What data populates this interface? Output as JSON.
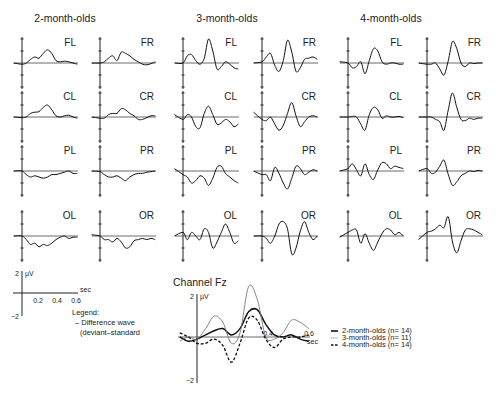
{
  "chart_data": {
    "type": "line",
    "groups": [
      {
        "name": "2-month-olds",
        "channels": [
          {
            "label": "FL",
            "x": [
              -0.1,
              0,
              0.05,
              0.1,
              0.15,
              0.2,
              0.25,
              0.3,
              0.35,
              0.4,
              0.45,
              0.5,
              0.55,
              0.6,
              0.65
            ],
            "y": [
              0,
              -0.1,
              0,
              0.3,
              0.5,
              0.4,
              0.8,
              1.1,
              0.8,
              0.2,
              0.1,
              0.15,
              0.1,
              0,
              -0.1
            ]
          },
          {
            "label": "FR",
            "x": [
              -0.1,
              0,
              0.05,
              0.1,
              0.15,
              0.2,
              0.25,
              0.3,
              0.35,
              0.4,
              0.45,
              0.5,
              0.55,
              0.6,
              0.65
            ],
            "y": [
              0,
              0,
              0.1,
              0.4,
              0.6,
              0.2,
              0.9,
              0.8,
              0.6,
              0.3,
              0.1,
              -0.1,
              -0.15,
              -0.05,
              0.1
            ]
          },
          {
            "label": "CL",
            "x": [
              -0.1,
              0,
              0.05,
              0.1,
              0.15,
              0.2,
              0.25,
              0.3,
              0.35,
              0.4,
              0.45,
              0.5,
              0.55,
              0.6,
              0.65
            ],
            "y": [
              0,
              -0.05,
              0,
              0.3,
              0.4,
              0.45,
              0.8,
              1.0,
              0.6,
              0.1,
              0,
              0.1,
              0.15,
              0,
              -0.1
            ]
          },
          {
            "label": "CR",
            "x": [
              -0.1,
              0,
              0.05,
              0.1,
              0.15,
              0.2,
              0.25,
              0.3,
              0.35,
              0.4,
              0.45,
              0.5,
              0.55,
              0.6,
              0.65
            ],
            "y": [
              0,
              -0.1,
              -0.1,
              0.2,
              0.3,
              0.3,
              0.7,
              0.6,
              0.3,
              0.1,
              -0.2,
              -0.2,
              -0.05,
              0.1,
              0.1
            ]
          },
          {
            "label": "PL",
            "x": [
              -0.1,
              0,
              0.05,
              0.1,
              0.15,
              0.2,
              0.25,
              0.3,
              0.35,
              0.4,
              0.45,
              0.5,
              0.55,
              0.6,
              0.65
            ],
            "y": [
              0,
              0,
              -0.3,
              -0.5,
              -0.4,
              -0.5,
              -0.6,
              -0.5,
              -0.3,
              -0.3,
              -0.2,
              -0.1,
              0,
              -0.2,
              -0.2
            ]
          },
          {
            "label": "PR",
            "x": [
              -0.1,
              0,
              0.05,
              0.1,
              0.15,
              0.2,
              0.25,
              0.3,
              0.35,
              0.4,
              0.45,
              0.5,
              0.55,
              0.6,
              0.65
            ],
            "y": [
              0,
              -0.05,
              -0.3,
              -0.5,
              -0.5,
              -0.4,
              -0.6,
              -0.8,
              -0.5,
              -0.3,
              -0.2,
              -0.2,
              -0.1,
              -0.05,
              0
            ]
          },
          {
            "label": "OL",
            "x": [
              -0.1,
              0,
              0.05,
              0.1,
              0.15,
              0.2,
              0.25,
              0.3,
              0.35,
              0.4,
              0.45,
              0.5,
              0.55,
              0.6,
              0.65
            ],
            "y": [
              0,
              0,
              -0.3,
              -0.7,
              -0.6,
              -0.9,
              -0.7,
              -0.8,
              -0.6,
              -0.3,
              -0.1,
              0,
              -0.2,
              -0.1,
              -0.1
            ]
          },
          {
            "label": "OR",
            "x": [
              -0.1,
              0,
              0.05,
              0.1,
              0.15,
              0.2,
              0.25,
              0.3,
              0.35,
              0.4,
              0.45,
              0.5,
              0.55,
              0.6,
              0.65
            ],
            "y": [
              0.1,
              0,
              -0.3,
              -0.3,
              -0.5,
              -0.2,
              -0.5,
              -1.0,
              -0.9,
              -0.4,
              -0.3,
              -0.2,
              -0.3,
              -0.2,
              -0.3
            ]
          }
        ]
      },
      {
        "name": "3-month-olds",
        "channels": [
          {
            "label": "FL",
            "x": [
              -0.1,
              0,
              0.05,
              0.1,
              0.15,
              0.2,
              0.25,
              0.3,
              0.35,
              0.4,
              0.45,
              0.5,
              0.55,
              0.6,
              0.65
            ],
            "y": [
              0,
              0,
              0.6,
              0.7,
              0.2,
              -0.1,
              0.4,
              2.0,
              1.0,
              -0.5,
              -0.3,
              0.1,
              -0.1,
              -0.4,
              -0.5
            ]
          },
          {
            "label": "FR",
            "x": [
              -0.1,
              0,
              0.05,
              0.1,
              0.15,
              0.2,
              0.25,
              0.3,
              0.35,
              0.4,
              0.45,
              0.5,
              0.55,
              0.6,
              0.65
            ],
            "y": [
              0,
              0.1,
              0.5,
              0.8,
              -0.2,
              -0.7,
              0.2,
              1.9,
              0.9,
              -0.7,
              -0.4,
              0.3,
              0.4,
              0.5,
              0.3
            ]
          },
          {
            "label": "CL",
            "x": [
              -0.1,
              0,
              0.05,
              0.1,
              0.15,
              0.2,
              0.25,
              0.3,
              0.35,
              0.4,
              0.45,
              0.5,
              0.55,
              0.6,
              0.65
            ],
            "y": [
              0.2,
              -0.2,
              0.2,
              0,
              -0.8,
              -0.9,
              0.3,
              0.9,
              0.2,
              -0.6,
              -0.5,
              -0.2,
              -0.4,
              -0.8,
              -0.6
            ]
          },
          {
            "label": "CR",
            "x": [
              -0.1,
              0,
              0.05,
              0.1,
              0.15,
              0.2,
              0.25,
              0.3,
              0.35,
              0.4,
              0.45,
              0.5,
              0.55,
              0.6,
              0.65
            ],
            "y": [
              0.4,
              -0.2,
              -0.3,
              0,
              -0.6,
              -1.1,
              -0.7,
              0.3,
              1.2,
              0.1,
              -0.8,
              -0.4,
              0,
              0.1,
              0
            ]
          },
          {
            "label": "PL",
            "x": [
              -0.1,
              0,
              0.05,
              0.1,
              0.15,
              0.2,
              0.25,
              0.3,
              0.35,
              0.4,
              0.45,
              0.5,
              0.55,
              0.6,
              0.65
            ],
            "y": [
              0.2,
              -0.3,
              -0.5,
              -1.0,
              -0.8,
              -0.4,
              -0.6,
              -1.2,
              -0.6,
              0.3,
              0.4,
              -0.2,
              -0.5,
              -0.8,
              -1.0
            ]
          },
          {
            "label": "PR",
            "x": [
              -0.1,
              0,
              0.05,
              0.1,
              0.15,
              0.2,
              0.25,
              0.3,
              0.35,
              0.4,
              0.45,
              0.5,
              0.55,
              0.6,
              0.65
            ],
            "y": [
              0,
              -0.3,
              -0.3,
              -0.8,
              0.3,
              -0.2,
              -1.0,
              -1.5,
              -0.6,
              0.4,
              0.2,
              -0.3,
              -0.1,
              0.1,
              0
            ]
          },
          {
            "label": "OL",
            "x": [
              -0.1,
              0,
              0.05,
              0.1,
              0.15,
              0.2,
              0.25,
              0.3,
              0.35,
              0.4,
              0.45,
              0.5,
              0.55,
              0.6,
              0.65
            ],
            "y": [
              0,
              0.3,
              -0.3,
              0.3,
              0,
              -0.3,
              0.6,
              0.3,
              -1.0,
              -0.5,
              0.3,
              1.0,
              0.3,
              -0.6,
              -0.4
            ]
          },
          {
            "label": "OR",
            "x": [
              -0.1,
              0,
              0.05,
              0.1,
              0.15,
              0.2,
              0.25,
              0.3,
              0.35,
              0.4,
              0.45,
              0.5,
              0.55,
              0.6,
              0.65
            ],
            "y": [
              0,
              0,
              -0.2,
              -0.6,
              0,
              1.0,
              1.2,
              0.6,
              -1.5,
              -1.0,
              0.4,
              1.2,
              0.3,
              -0.3,
              0
            ]
          }
        ]
      },
      {
        "name": "4-month-olds",
        "channels": [
          {
            "label": "FL",
            "x": [
              -0.1,
              0,
              0.05,
              0.1,
              0.15,
              0.2,
              0.25,
              0.3,
              0.35,
              0.4,
              0.45,
              0.5,
              0.55,
              0.6,
              0.65
            ],
            "y": [
              0.1,
              0,
              -0.4,
              -0.3,
              0.1,
              -0.9,
              0.2,
              1.2,
              1.0,
              0.1,
              -0.1,
              0,
              0,
              -0.1,
              -0.1
            ]
          },
          {
            "label": "FR",
            "x": [
              -0.1,
              0,
              0.05,
              0.1,
              0.15,
              0.2,
              0.25,
              0.3,
              0.35,
              0.4,
              0.45,
              0.5,
              0.55,
              0.6,
              0.65
            ],
            "y": [
              0,
              -0.1,
              -0.1,
              0,
              -0.5,
              -1.0,
              0.2,
              1.8,
              1.2,
              0,
              -0.3,
              0,
              -0.05,
              0,
              0
            ]
          },
          {
            "label": "CL",
            "x": [
              -0.1,
              0,
              0.05,
              0.1,
              0.15,
              0.2,
              0.25,
              0.3,
              0.35,
              0.4,
              0.45,
              0.5,
              0.55,
              0.6,
              0.65
            ],
            "y": [
              0,
              0,
              0.05,
              0,
              -0.6,
              -1.1,
              0.2,
              0.8,
              0.6,
              -0.1,
              0.1,
              0,
              0,
              0.05,
              -0.05
            ]
          },
          {
            "label": "CR",
            "x": [
              -0.1,
              0,
              0.05,
              0.1,
              0.15,
              0.2,
              0.25,
              0.3,
              0.35,
              0.4,
              0.45,
              0.5,
              0.55,
              0.6,
              0.65
            ],
            "y": [
              0,
              0,
              0,
              -0.2,
              -0.4,
              -1.1,
              0.6,
              2.0,
              0.8,
              -0.2,
              -0.3,
              -0.1,
              -0.2,
              -0.1,
              -0.1
            ]
          },
          {
            "label": "PL",
            "x": [
              -0.1,
              0,
              0.05,
              0.1,
              0.15,
              0.2,
              0.25,
              0.3,
              0.35,
              0.4,
              0.45,
              0.5,
              0.55,
              0.6,
              0.65
            ],
            "y": [
              0,
              0.2,
              0.6,
              0.1,
              -0.4,
              0.6,
              -0.3,
              -0.7,
              0.1,
              0.7,
              0.6,
              0.2,
              0.4,
              0.3,
              0.2
            ]
          },
          {
            "label": "PR",
            "x": [
              -0.1,
              0,
              0.05,
              0.1,
              0.15,
              0.2,
              0.25,
              0.3,
              0.35,
              0.4,
              0.45,
              0.5,
              0.55,
              0.6,
              0.65
            ],
            "y": [
              0,
              0.2,
              -0.2,
              -0.1,
              0.4,
              0.9,
              -0.3,
              -1.2,
              -0.9,
              -0.4,
              -0.2,
              0,
              -0.05,
              0.05,
              0
            ]
          },
          {
            "label": "OL",
            "x": [
              -0.1,
              0,
              0.05,
              0.1,
              0.15,
              0.2,
              0.25,
              0.3,
              0.35,
              0.4,
              0.45,
              0.5,
              0.55,
              0.6,
              0.65
            ],
            "y": [
              -0.1,
              0.3,
              0.5,
              0.5,
              -0.6,
              0.2,
              -0.6,
              -1.2,
              -0.5,
              0.2,
              0.6,
              0.5,
              0.1,
              0.3,
              0
            ]
          },
          {
            "label": "OR",
            "x": [
              -0.1,
              0,
              0.05,
              0.1,
              0.15,
              0.2,
              0.25,
              0.3,
              0.35,
              0.4,
              0.45,
              0.5,
              0.55,
              0.6,
              0.65
            ],
            "y": [
              -0.3,
              0.3,
              0.4,
              0.6,
              0.9,
              0.7,
              1.6,
              -0.5,
              -1.4,
              -0.4,
              0.5,
              0.6,
              0.5,
              0.3,
              0.1
            ]
          }
        ]
      }
    ],
    "scale_legend": {
      "y_label": "µV",
      "y_ticks": [
        "2",
        "−2"
      ],
      "x_label": "sec",
      "x_ticks": [
        "0.2",
        "0.4",
        "0.6"
      ],
      "legend_title": "Legend:",
      "legend_items": [
        "– Difference wave",
        "(deviant–standard"
      ]
    },
    "fz_panel": {
      "title": "Channel Fz",
      "y_label": "µV",
      "y_ticks": [
        "2",
        "−2"
      ],
      "x_label": "sec",
      "x_ticks": [
        "0.4",
        "0.6"
      ],
      "ylim": [
        -2,
        2
      ],
      "xlim": [
        -0.1,
        0.65
      ],
      "series": [
        {
          "name": "2-month-olds (n= 14)",
          "style": "solid",
          "x": [
            -0.1,
            -0.05,
            0,
            0.05,
            0.1,
            0.15,
            0.2,
            0.25,
            0.3,
            0.35,
            0.4,
            0.45,
            0.5,
            0.55,
            0.6,
            0.65
          ],
          "y": [
            0,
            -0.2,
            -0.1,
            0.1,
            0.3,
            0.4,
            0.1,
            0.4,
            1.2,
            1.3,
            0.6,
            0.1,
            0,
            0.1,
            -0.1,
            -0.2
          ]
        },
        {
          "name": "3-month-olds (n= 11)",
          "style": "dotted",
          "x": [
            -0.1,
            -0.05,
            0,
            0.05,
            0.1,
            0.15,
            0.2,
            0.25,
            0.3,
            0.35,
            0.4,
            0.45,
            0.5,
            0.55,
            0.6,
            0.65
          ],
          "y": [
            -0.2,
            0,
            -0.1,
            0.4,
            1.0,
            0.7,
            -0.3,
            0.2,
            2.4,
            1.8,
            0,
            -0.1,
            0.2,
            0.8,
            0.7,
            0.4
          ]
        },
        {
          "name": "4-month-olds (n= 14)",
          "style": "dashed",
          "x": [
            -0.1,
            -0.05,
            0,
            0.05,
            0.1,
            0.15,
            0.2,
            0.25,
            0.3,
            0.35,
            0.4,
            0.45,
            0.5,
            0.55,
            0.6,
            0.65
          ],
          "y": [
            0.2,
            0,
            -0.3,
            -0.3,
            -0.1,
            -0.4,
            -1.2,
            -0.3,
            0.9,
            0.8,
            -0.1,
            -0.5,
            -0.1,
            0,
            0,
            0.1
          ]
        }
      ]
    }
  }
}
